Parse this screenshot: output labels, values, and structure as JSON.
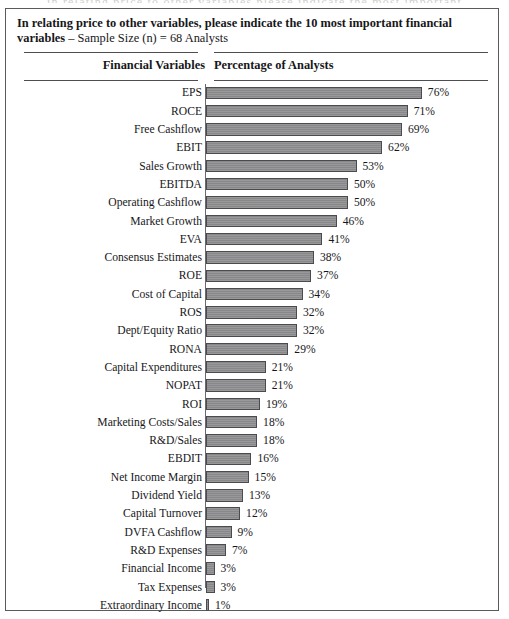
{
  "ghost_text": "in relating price to other variables please indicate the most important",
  "caption": {
    "bold_part": "In relating price to other variables, please indicate the 10 most important financial variables",
    "normal_part": " – Sample Size (n) = 68 Analysts"
  },
  "columns": {
    "variables_header": "Financial Variables",
    "percentage_header": "Percentage of Analysts"
  },
  "style": {
    "bar_fill": "#8d8d8f",
    "bar_border": "#4b4b4f",
    "frame_border": "#5a5a5e",
    "rule_color": "#4e4e52",
    "text_color": "#17171a"
  },
  "chart_data": {
    "type": "bar",
    "orientation": "horizontal",
    "title": "In relating price to other variables, please indicate the 10 most important financial variables – Sample Size (n) = 68 Analysts",
    "xlabel": "Percentage of Analysts",
    "ylabel": "Financial Variables",
    "xlim": [
      0,
      80
    ],
    "grid": false,
    "legend": false,
    "value_suffix": "%",
    "sample_size": 68,
    "categories": [
      "EPS",
      "ROCE",
      "Free Cashflow",
      "EBIT",
      "Sales Growth",
      "EBITDA",
      "Operating Cashflow",
      "Market Growth",
      "EVA",
      "Consensus Estimates",
      "ROE",
      "Cost of Capital",
      "ROS",
      "Dept/Equity Ratio",
      "RONA",
      "Capital Expenditures",
      "NOPAT",
      "ROI",
      "Marketing Costs/Sales",
      "R&D/Sales",
      "EBDIT",
      "Net Income Margin",
      "Dividend Yield",
      "Capital Turnover",
      "DVFA Cashflow",
      "R&D Expenses",
      "Financial Income",
      "Tax Expenses",
      "Extraordinary Income"
    ],
    "values": [
      76,
      71,
      69,
      62,
      53,
      50,
      50,
      46,
      41,
      38,
      37,
      34,
      32,
      32,
      29,
      21,
      21,
      19,
      18,
      18,
      16,
      15,
      13,
      12,
      9,
      7,
      3,
      3,
      1
    ],
    "value_labels": [
      "76%",
      "71%",
      "69%",
      "62%",
      "53%",
      "50%",
      "50%",
      "46%",
      "41%",
      "38%",
      "37%",
      "34%",
      "32%",
      "32%",
      "29%",
      "21%",
      "21%",
      "19%",
      "18%",
      "18%",
      "16%",
      "15%",
      "13%",
      "12%",
      "9%",
      "7%",
      "3%",
      "3%",
      "1%"
    ]
  }
}
